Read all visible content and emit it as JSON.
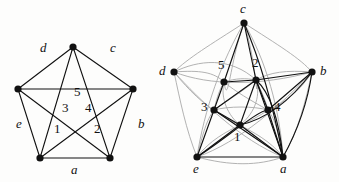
{
  "image": {
    "title": "K5 graph and its face-labelled redrawing",
    "width": 339,
    "height": 182,
    "background": "#fdfdfc"
  },
  "style": {
    "edge_color": "#111111",
    "ghost_edge_color": "#a8a8a8",
    "vertex_color": "#111111",
    "vertex_radius": 3.6,
    "edge_width": 1.1,
    "ghost_edge_width": 0.9
  },
  "figures": [
    {
      "id": "left",
      "name": "k5-pentagon-drawing",
      "vertex_labels": [
        "a",
        "b",
        "c",
        "d",
        "e"
      ],
      "face_labels": [
        "1",
        "2",
        "3",
        "4",
        "5"
      ],
      "vertices": [
        {
          "name": "top",
          "x": 73,
          "y": 47
        },
        {
          "name": "left",
          "x": 18,
          "y": 89
        },
        {
          "name": "right",
          "x": 133,
          "y": 89
        },
        {
          "name": "bottom-left",
          "x": 40,
          "y": 158
        },
        {
          "name": "bottom-right",
          "x": 110,
          "y": 158
        }
      ],
      "edge_label_positions": [
        {
          "label": "a",
          "x": 71,
          "y": 168
        },
        {
          "label": "b",
          "x": 138,
          "y": 123
        },
        {
          "label": "c",
          "x": 110,
          "y": 47
        },
        {
          "label": "d",
          "x": 40,
          "y": 47
        },
        {
          "label": "e",
          "x": 16,
          "y": 123
        }
      ],
      "face_label_positions": [
        {
          "label": "1",
          "x": 54,
          "y": 127
        },
        {
          "label": "2",
          "x": 94,
          "y": 127
        },
        {
          "label": "3",
          "x": 62,
          "y": 106
        },
        {
          "label": "4",
          "x": 85,
          "y": 106
        },
        {
          "label": "5",
          "x": 74,
          "y": 90
        }
      ]
    },
    {
      "id": "right",
      "name": "k5-with-dual-overlay",
      "vertex_labels": [
        "a",
        "b",
        "c",
        "d",
        "e"
      ],
      "face_labels": [
        "1",
        "2",
        "3",
        "4",
        "5"
      ],
      "outer_vertices": [
        {
          "name": "c",
          "x": 74,
          "y": 23
        },
        {
          "name": "b",
          "x": 142,
          "y": 72
        },
        {
          "name": "a",
          "x": 113,
          "y": 157
        },
        {
          "name": "e",
          "x": 27,
          "y": 157
        },
        {
          "name": "d",
          "x": 4,
          "y": 72
        }
      ],
      "inner_vertices": [
        {
          "name": "5",
          "x": 54,
          "y": 82
        },
        {
          "name": "2",
          "x": 86,
          "y": 80
        },
        {
          "name": "3",
          "x": 44,
          "y": 110
        },
        {
          "name": "4",
          "x": 98,
          "y": 110
        },
        {
          "name": "1",
          "x": 70,
          "y": 125
        }
      ],
      "outer_label_positions": [
        {
          "label": "c",
          "x": 72,
          "y": 8
        },
        {
          "label": "b",
          "x": 152,
          "y": 68
        },
        {
          "label": "a",
          "x": 111,
          "y": 170
        },
        {
          "label": "e",
          "x": 24,
          "y": 170
        },
        {
          "label": "d",
          "x": -11,
          "y": 68
        }
      ],
      "inner_label_positions": [
        {
          "label": "5",
          "x": 48,
          "y": 64
        },
        {
          "label": "2",
          "x": 82,
          "y": 62
        },
        {
          "label": "3",
          "x": 32,
          "y": 104
        },
        {
          "label": "4",
          "x": 104,
          "y": 104
        },
        {
          "label": "1",
          "x": 64,
          "y": 134
        }
      ]
    }
  ]
}
